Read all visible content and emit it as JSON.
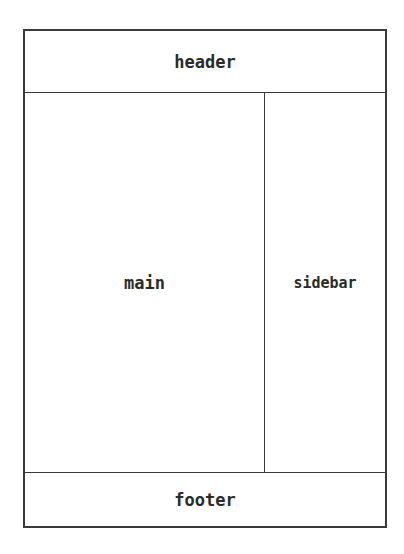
{
  "layout": {
    "header": {
      "label": "header"
    },
    "main": {
      "label": "main"
    },
    "sidebar": {
      "label": "sidebar"
    },
    "footer": {
      "label": "footer"
    }
  },
  "colors": {
    "stroke": "#3a3a3a",
    "text": "#2a2a2a",
    "background": "#ffffff"
  }
}
